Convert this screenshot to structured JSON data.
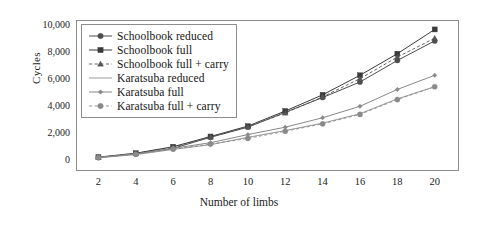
{
  "chart_data": {
    "type": "line",
    "title": "",
    "xlabel": "Number of limbs",
    "ylabel": "Cycles",
    "x": [
      2,
      4,
      6,
      8,
      10,
      12,
      14,
      16,
      18,
      20
    ],
    "xticklabels": [
      "2",
      "4",
      "6",
      "8",
      "10",
      "12",
      "14",
      "16",
      "18",
      "20"
    ],
    "yticklabels": [
      "0",
      "2,000",
      "4,000",
      "6,000",
      "8,000",
      "10,000"
    ],
    "yticks": [
      0,
      2000,
      4000,
      6000,
      8000,
      10000
    ],
    "xlim": [
      0.8,
      21.3
    ],
    "ylim": [
      -800,
      10400
    ],
    "grid": true,
    "grid_axis": "y",
    "legend_position": "upper left",
    "series": [
      {
        "name": "Schoolbook reduced",
        "marker": "circle",
        "linestyle": "solid",
        "color": "#4d4d4d",
        "values": [
          200,
          460,
          880,
          1700,
          2450,
          3550,
          4650,
          5800,
          7400,
          8850
        ]
      },
      {
        "name": "Schoolbook full",
        "marker": "square",
        "linestyle": "solid",
        "color": "#3a3a3a",
        "values": [
          230,
          520,
          1000,
          1760,
          2530,
          3650,
          4850,
          6300,
          7900,
          9700
        ]
      },
      {
        "name": "Schoolbook full + carry",
        "marker": "triangle",
        "linestyle": "dashed",
        "color": "#555555",
        "values": [
          220,
          500,
          960,
          1720,
          2480,
          3500,
          4700,
          6050,
          7650,
          9050
        ]
      },
      {
        "name": "Karatsuba reduced",
        "marker": "none",
        "linestyle": "solid",
        "color": "#9a9a9a",
        "values": [
          180,
          420,
          800,
          1150,
          1700,
          2200,
          2750,
          3450,
          4550,
          5450
        ]
      },
      {
        "name": "Karatsuba full",
        "marker": "diamond",
        "linestyle": "solid",
        "color": "#888888",
        "values": [
          210,
          470,
          880,
          1300,
          1900,
          2450,
          3150,
          4000,
          5250,
          6300
        ]
      },
      {
        "name": "Karatsuba full + carry",
        "marker": "circle",
        "linestyle": "dashed",
        "color": "#8a8a8a",
        "values": [
          195,
          440,
          820,
          1200,
          1620,
          2150,
          2700,
          3400,
          4500,
          5450
        ]
      }
    ]
  },
  "axes": {
    "ylabel": "Cycles",
    "xlabel": "Number of limbs",
    "yticks": [
      "10,000",
      "8,000",
      "6,000",
      "4,000",
      "2,000",
      "0"
    ],
    "xticks": [
      "2",
      "4",
      "6",
      "8",
      "10",
      "12",
      "14",
      "16",
      "18",
      "20"
    ]
  },
  "legend": {
    "items": [
      {
        "label": "Schoolbook reduced"
      },
      {
        "label": "Schoolbook full"
      },
      {
        "label": "Schoolbook full + carry"
      },
      {
        "label": "Karatsuba reduced"
      },
      {
        "label": "Karatsuba full"
      },
      {
        "label": "Karatsuba full + carry"
      }
    ]
  },
  "colors": {
    "frame": "#8d8d8d",
    "grid": "#e2e2e2",
    "text": "#1a1a1a"
  }
}
